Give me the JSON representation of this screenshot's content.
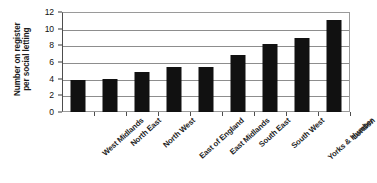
{
  "chart_data": {
    "type": "bar",
    "title": "",
    "subtitle": "",
    "xlabel": "",
    "ylabel": "Number on register per social letting",
    "ylabel_lines": [
      "Number on register",
      "per social letting"
    ],
    "categories": [
      "West Midlands",
      "North East",
      "North West",
      "East of England",
      "East Midlands",
      "South East",
      "South West",
      "Yorks & Humber",
      "London"
    ],
    "values": [
      3.9,
      4.0,
      4.8,
      5.4,
      5.4,
      6.8,
      8.2,
      8.9,
      11.1
    ],
    "ylim": [
      0,
      12
    ],
    "yticks": [
      0,
      2,
      4,
      6,
      8,
      10,
      12
    ],
    "ytick_labels": [
      "0",
      "2",
      "4",
      "6",
      "8",
      "10",
      "12"
    ],
    "grid": true,
    "grid_axis": "y",
    "legend": false,
    "legend_position": "none",
    "bar_color": "#111111",
    "xtick_rotation": -45
  }
}
